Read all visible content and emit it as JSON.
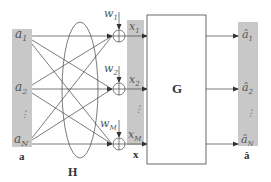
{
  "diagram": {
    "input_vector": {
      "label": "a",
      "entries": [
        {
          "sym": "a",
          "sub": "1"
        },
        {
          "sym": "a",
          "sub": "2"
        },
        {
          "sym": "a",
          "sub": "N"
        }
      ],
      "ellipsis": "⋮"
    },
    "channel_label": "H",
    "noise": [
      {
        "sym": "w",
        "sub": "1"
      },
      {
        "sym": "w",
        "sub": "2"
      },
      {
        "sym": "w",
        "sub": "M"
      }
    ],
    "received_vector": {
      "label": "x",
      "entries": [
        {
          "sym": "x",
          "sub": "1"
        },
        {
          "sym": "x",
          "sub": "2"
        },
        {
          "sym": "x",
          "sub": "M"
        }
      ],
      "ellipsis": "⋮"
    },
    "processor_label": "G",
    "output_vector": {
      "label": "â",
      "entries": [
        {
          "sym": "â",
          "sub": "1"
        },
        {
          "sym": "â",
          "sub": "2"
        },
        {
          "sym": "â",
          "sub": "N"
        }
      ],
      "ellipsis": "⋮"
    },
    "colors": {
      "bar_fill": "#c8c8c8",
      "line": "#333333",
      "text": "#555555"
    }
  }
}
